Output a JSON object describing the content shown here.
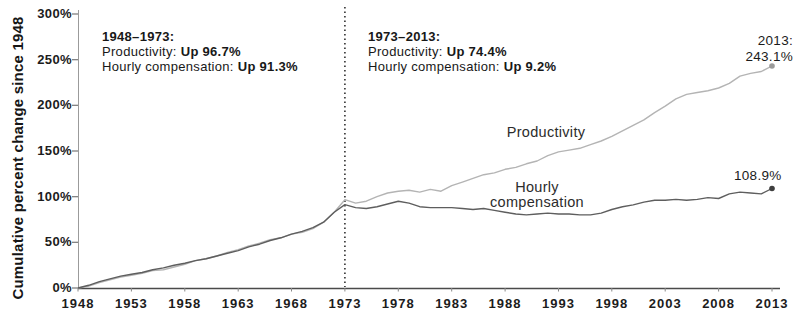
{
  "figure": {
    "ylabel": "Cumulative percent change since 1948",
    "annotations": {
      "left": {
        "title": "1948–1973:",
        "items": [
          {
            "label": "Productivity:",
            "value": "Up 96.7%"
          },
          {
            "label": "Hourly compensation:",
            "value": "Up 91.3%"
          }
        ]
      },
      "right": {
        "title": "1973–2013:",
        "items": [
          {
            "label": "Productivity:",
            "value": "Up 74.4%"
          },
          {
            "label": "Hourly compensation:",
            "value": "Up 9.2%"
          }
        ]
      }
    },
    "end_labels": {
      "productivity": [
        "2013:",
        "243.1%"
      ],
      "compensation": "108.9%"
    }
  },
  "chart_data": {
    "type": "line",
    "title": "",
    "xlabel": "",
    "ylabel": "Cumulative percent change since 1948",
    "xlim": [
      1948,
      2013
    ],
    "ylim": [
      0,
      300
    ],
    "grid": false,
    "legend_position": "inline",
    "reference_line": {
      "x": 1973,
      "style": "dashed-vertical"
    },
    "x_ticks": [
      1948,
      1953,
      1958,
      1963,
      1968,
      1973,
      1978,
      1983,
      1988,
      1993,
      1998,
      2003,
      2008,
      2013
    ],
    "y_ticks": [
      0,
      50,
      100,
      150,
      200,
      250,
      300
    ],
    "y_tick_suffix": "%",
    "x": [
      1948,
      1949,
      1950,
      1951,
      1952,
      1953,
      1954,
      1955,
      1956,
      1957,
      1958,
      1959,
      1960,
      1961,
      1962,
      1963,
      1964,
      1965,
      1966,
      1967,
      1968,
      1969,
      1970,
      1971,
      1972,
      1973,
      1974,
      1975,
      1976,
      1977,
      1978,
      1979,
      1980,
      1981,
      1982,
      1983,
      1984,
      1985,
      1986,
      1987,
      1988,
      1989,
      1990,
      1991,
      1992,
      1993,
      1994,
      1995,
      1996,
      1997,
      1998,
      1999,
      2000,
      2001,
      2002,
      2003,
      2004,
      2005,
      2006,
      2007,
      2008,
      2009,
      2010,
      2011,
      2012,
      2013
    ],
    "series": [
      {
        "name": "Productivity",
        "color": "#b4b4b4",
        "marker_color": "#9a9a9a",
        "end_value": 243.1,
        "values": [
          0,
          2,
          6,
          9,
          12,
          14,
          16,
          19,
          20,
          23,
          26,
          30,
          32,
          35,
          39,
          42,
          46,
          49,
          53,
          55,
          59,
          61,
          65,
          72,
          83,
          96.7,
          93,
          95,
          100,
          104,
          106,
          107,
          105,
          108,
          106,
          112,
          116,
          120,
          124,
          126,
          130,
          132,
          136,
          139,
          145,
          149,
          151,
          153,
          157,
          161,
          166,
          172,
          178,
          184,
          192,
          199,
          207,
          212,
          214,
          216,
          219,
          224,
          232,
          235,
          237,
          243.1
        ]
      },
      {
        "name": "Hourly compensation",
        "color": "#5e5e5e",
        "marker_color": "#3f3f3f",
        "end_value": 108.9,
        "values": [
          0,
          3,
          7,
          10,
          13,
          15,
          17,
          20,
          22,
          25,
          27,
          30,
          32,
          35,
          38,
          41,
          45,
          48,
          52,
          55,
          59,
          62,
          66,
          72,
          83,
          91.3,
          88,
          87,
          89,
          92,
          95,
          93,
          89,
          88,
          88,
          88,
          87,
          86,
          87,
          85,
          83,
          81,
          80,
          81,
          82,
          81,
          81,
          80,
          80,
          82,
          86,
          89,
          91,
          94,
          96,
          96,
          97,
          96,
          97,
          99,
          98,
          103,
          105,
          104,
          103,
          108.9
        ]
      }
    ]
  }
}
